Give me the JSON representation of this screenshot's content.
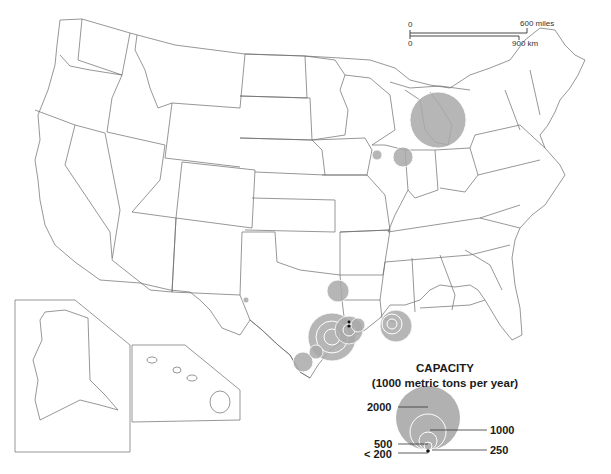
{
  "map": {
    "region": "United States (with Alaska and Hawaii insets)",
    "symbol_type": "proportional circles",
    "symbol_color": "#a9a9a9"
  },
  "scale_bar": {
    "miles_start": "0",
    "miles_end": "600",
    "miles_unit": "miles",
    "km_start": "0",
    "km_end": "900",
    "km_unit": "km"
  },
  "legend": {
    "title": "CAPACITY",
    "subtitle": "(1000 metric tons per year)",
    "classes": [
      {
        "label": "2000",
        "value": 2000
      },
      {
        "label": "1000",
        "value": 1000
      },
      {
        "label": "500",
        "value": 500
      },
      {
        "label": "250",
        "value": 250
      },
      {
        "label": "< 200",
        "value": 200
      }
    ]
  },
  "sites": [
    {
      "location": "Michigan / Ohio (Great Lakes)",
      "size": "2000+"
    },
    {
      "location": "NW Indiana / Chicago area",
      "size": "~500"
    },
    {
      "location": "Illinois (NW)",
      "size": "~200"
    },
    {
      "location": "West Texas",
      "size": "< 200"
    },
    {
      "location": "NE Texas / Louisiana border",
      "size": "~500"
    },
    {
      "location": "Texas Gulf Coast (Houston–Beaumont)",
      "size": "cluster, up to 2000"
    },
    {
      "location": "Texas Gulf Coast (Corpus Christi)",
      "size": "~500"
    },
    {
      "location": "Louisiana (Baton Rouge–New Orleans)",
      "size": "cluster, ~1000"
    }
  ]
}
